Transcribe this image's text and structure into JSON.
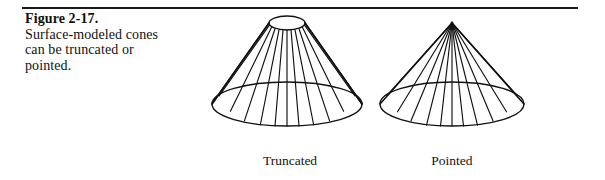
{
  "page": {
    "background_color": "#ffffff",
    "ink_color": "#111111",
    "width": 605,
    "height": 180
  },
  "rule": {
    "name": "top-divider",
    "color": "#1a1a1a"
  },
  "caption": {
    "figure_number": "Figure 2-17.",
    "body": "Surface-modeled\ncones can be\ntruncated or\npointed.",
    "body_lines": [
      "Surface-modeled",
      "cones can be",
      "truncated or",
      "pointed."
    ]
  },
  "figure": {
    "title": "Surface-modeled cones",
    "line_color": "#111111",
    "fill_color": "#ffffff",
    "cones": [
      {
        "id": "truncated-cone",
        "label_line1": "Truncated",
        "label_line2": "cone",
        "apex_type": "truncated",
        "top_ellipse_rx": 18,
        "top_ellipse_ry": 7,
        "base_ellipse_rx": 75,
        "base_ellipse_ry": 22,
        "height": 86,
        "num_surface_lines": 13
      },
      {
        "id": "pointed-cone",
        "label_line1": "Pointed",
        "label_line2": "cone",
        "apex_type": "pointed",
        "top_ellipse_rx": 0,
        "top_ellipse_ry": 0,
        "base_ellipse_rx": 72,
        "base_ellipse_ry": 22,
        "height": 92,
        "num_surface_lines": 13
      }
    ]
  }
}
